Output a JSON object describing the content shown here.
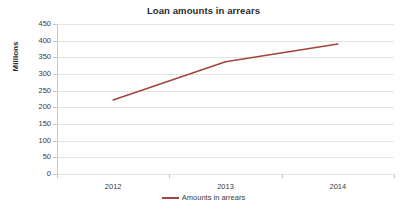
{
  "chart_data": {
    "type": "line",
    "title": "Loan amounts in arrears",
    "xlabel": "",
    "ylabel": "Millions",
    "categories": [
      "2012",
      "2013",
      "2014"
    ],
    "series": [
      {
        "name": "Amounts in arrears",
        "values": [
          222,
          337,
          390
        ],
        "color": "#A0453A"
      }
    ],
    "ylim": [
      0,
      450
    ],
    "yticks": [
      0,
      50,
      100,
      150,
      200,
      250,
      300,
      350,
      400,
      450
    ],
    "ytick_labels": [
      "0",
      "50",
      "100",
      "150",
      "200",
      "250",
      "300",
      "350",
      "400",
      "450"
    ],
    "grid": true,
    "grid_axis": "y",
    "legend": {
      "position": "bottom",
      "entries": [
        "Amounts in arrears"
      ]
    }
  },
  "colors": {
    "series_line": "#A0453A",
    "gridline": "#E4E4E4",
    "axis": "#B9B9B9",
    "text": "#3A3A3A",
    "title_text": "#2B2B2B",
    "background": "#FFFFFF"
  }
}
